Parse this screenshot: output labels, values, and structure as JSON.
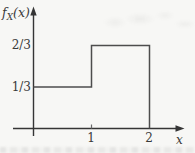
{
  "figure": {
    "ylabel_parts": {
      "f": "f",
      "sub": "X",
      "args": "(x)"
    },
    "xlabel": "x"
  },
  "chart_data": {
    "type": "line",
    "subtype": "step-function-density",
    "title": "",
    "xlabel": "x",
    "ylabel": "f_X(x)",
    "series": [
      {
        "name": "f_X(x)",
        "points_xy": [
          [
            0,
            0.3333
          ],
          [
            1,
            0.3333
          ],
          [
            1,
            0.6667
          ],
          [
            2,
            0.6667
          ],
          [
            2,
            0
          ]
        ]
      }
    ],
    "segments_description": "f_X(x) = 1/3 for 0 <= x < 1; f_X(x) = 2/3 for 1 <= x <= 2",
    "x_tick_values": [
      1,
      2
    ],
    "x_tick_labels": [
      "1",
      "2"
    ],
    "y_tick_values": [
      0.3333,
      0.6667
    ],
    "y_tick_labels": [
      "1/3",
      "2/3"
    ],
    "xlim": [
      0,
      2.6
    ],
    "ylim": [
      0,
      0.98
    ],
    "grid": false,
    "legend": "none",
    "line_color": "#4d4d4d",
    "axis_color": "#353535"
  }
}
